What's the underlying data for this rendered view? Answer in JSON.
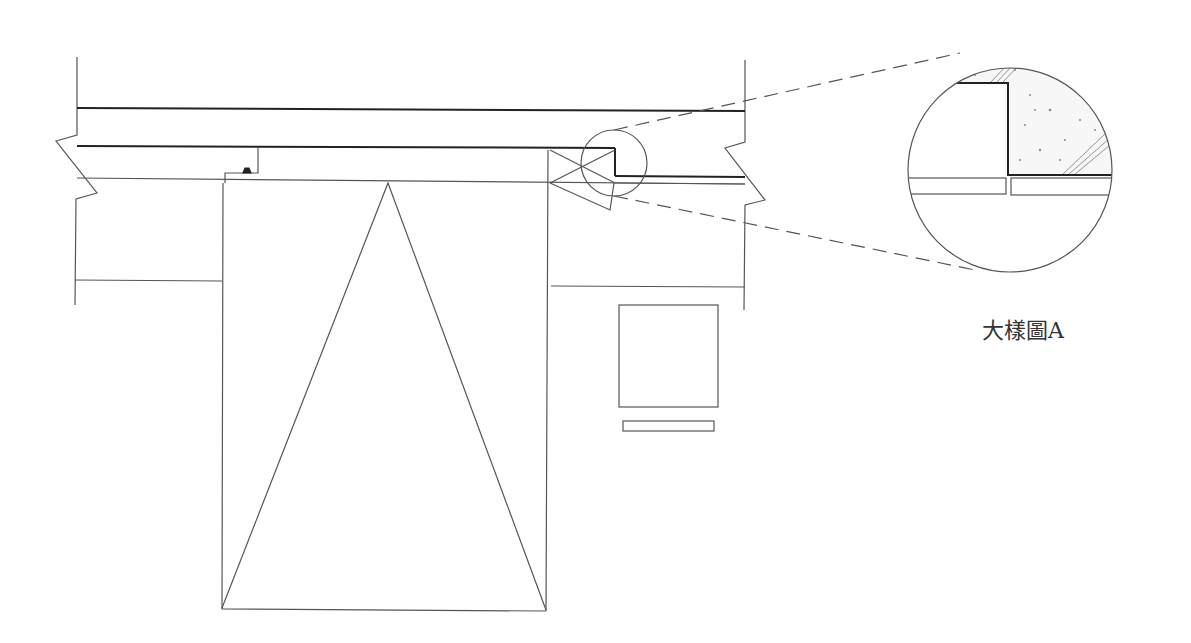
{
  "drawing": {
    "type": "architectural-section-detail",
    "detail_label": "大樣圖A",
    "colors": {
      "line": "#555555",
      "thick_line": "#222222",
      "stipple": "#999999",
      "background": "#ffffff"
    },
    "elements": [
      "wall-left-with-break-symbol",
      "wall-right-with-break-symbol",
      "ceiling-slab",
      "header-beam",
      "door-panel-with-opening-triangle",
      "hinge-detail",
      "detail-callout-circle",
      "magnified-detail-circle",
      "small-square-panel",
      "small-rectangular-strip"
    ]
  }
}
